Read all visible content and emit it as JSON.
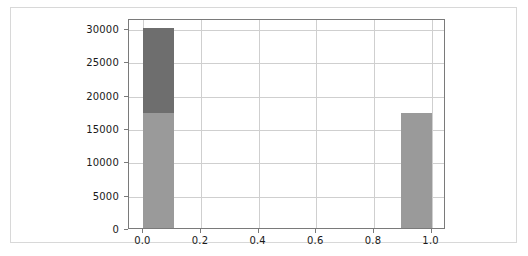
{
  "chart_data": {
    "type": "bar",
    "title": "",
    "subtitle": "",
    "xlabel": "",
    "ylabel": "",
    "xlim": [
      -0.05,
      1.05
    ],
    "ylim": [
      0,
      31500
    ],
    "grid": true,
    "legend": null,
    "orientation": "vertical",
    "stacked": true,
    "x_ticks": [
      {
        "value": 0.0,
        "label": "0.0"
      },
      {
        "value": 0.2,
        "label": "0.2"
      },
      {
        "value": 0.4,
        "label": "0.4"
      },
      {
        "value": 0.6,
        "label": "0.6"
      },
      {
        "value": 0.8,
        "label": "0.8"
      },
      {
        "value": 1.0,
        "label": "1.0"
      }
    ],
    "y_ticks": [
      {
        "value": 0,
        "label": "0"
      },
      {
        "value": 5000,
        "label": "5000"
      },
      {
        "value": 10000,
        "label": "10000"
      },
      {
        "value": 15000,
        "label": "15000"
      },
      {
        "value": 20000,
        "label": "20000"
      },
      {
        "value": 25000,
        "label": "25000"
      },
      {
        "value": 30000,
        "label": "30000"
      }
    ],
    "series": [
      {
        "name": "lower-segment",
        "color": "#9a9a9a",
        "values": [
          17200,
          17200
        ]
      },
      {
        "name": "upper-segment",
        "color": "#6e6e6e",
        "values": [
          12800,
          0
        ]
      }
    ],
    "bars": [
      {
        "name": "bar-at-zero",
        "x_start": 0.0,
        "x_end": 0.105,
        "total": 30000,
        "segments": [
          {
            "name": "lower",
            "from": 0,
            "to": 17200,
            "color": "#9a9a9a"
          },
          {
            "name": "upper",
            "from": 17200,
            "to": 30000,
            "color": "#6e6e6e"
          }
        ]
      },
      {
        "name": "bar-at-one",
        "x_start": 0.895,
        "x_end": 1.0,
        "total": 17200,
        "segments": [
          {
            "name": "lower",
            "from": 0,
            "to": 17200,
            "color": "#9a9a9a"
          }
        ]
      }
    ],
    "colors": {
      "lower_segment": "#9a9a9a",
      "upper_segment": "#6e6e6e",
      "gridline": "#cfcfcf",
      "axis": "#7a7a7a",
      "card_border": "#d8d8d8",
      "background": "#ffffff",
      "tick_text": "#1a1a1a"
    }
  }
}
